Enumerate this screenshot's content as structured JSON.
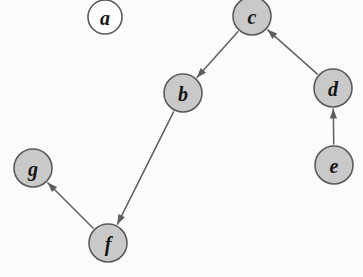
{
  "figure": {
    "width": 363,
    "height": 277,
    "background_color": "#fbfbfb"
  },
  "style": {
    "node_fill_filled": "#c9c9c9",
    "node_fill_empty": "#ffffff",
    "node_stroke": "#5a5a5a",
    "edge_color": "#5f5f5f",
    "label_color": "#151515",
    "node_radius": 19
  },
  "graph": {
    "type": "directed",
    "node_count": 7,
    "edge_count": 5,
    "nodes": [
      {
        "id": "a",
        "label": "a",
        "cx": 105,
        "cy": 17,
        "r": 17,
        "filled": false
      },
      {
        "id": "c",
        "label": "c",
        "cx": 252,
        "cy": 16,
        "r": 19,
        "filled": true
      },
      {
        "id": "b",
        "label": "b",
        "cx": 183,
        "cy": 93,
        "r": 19,
        "filled": true
      },
      {
        "id": "d",
        "label": "d",
        "cx": 333,
        "cy": 88,
        "r": 19,
        "filled": true
      },
      {
        "id": "e",
        "label": "e",
        "cx": 334,
        "cy": 165,
        "r": 19,
        "filled": true
      },
      {
        "id": "g",
        "label": "g",
        "cx": 33,
        "cy": 168,
        "r": 19,
        "filled": true
      },
      {
        "id": "f",
        "label": "f",
        "cx": 108,
        "cy": 243,
        "r": 19,
        "filled": true
      }
    ],
    "edges": [
      {
        "id": "c-b",
        "from": "c",
        "to": "b",
        "directed": true
      },
      {
        "id": "d-c",
        "from": "d",
        "to": "c",
        "directed": true
      },
      {
        "id": "e-d",
        "from": "e",
        "to": "d",
        "directed": true
      },
      {
        "id": "b-f",
        "from": "b",
        "to": "f",
        "directed": true
      },
      {
        "id": "f-g",
        "from": "f",
        "to": "g",
        "directed": true
      }
    ]
  }
}
